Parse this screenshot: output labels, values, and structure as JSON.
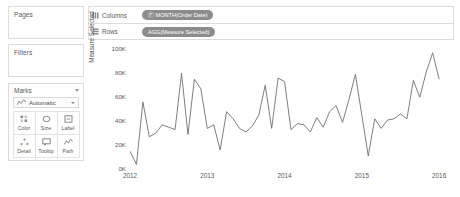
{
  "sidebar": {
    "pages": {
      "label": "Pages"
    },
    "filters": {
      "label": "Filters"
    },
    "marks": {
      "label": "Marks",
      "type_label": "Automatic",
      "type_icon": "line-chart-icon",
      "buttons": [
        {
          "label": "Color",
          "icon": "color-icon"
        },
        {
          "label": "Size",
          "icon": "size-icon"
        },
        {
          "label": "Label",
          "icon": "label-icon"
        },
        {
          "label": "Detail",
          "icon": "detail-icon"
        },
        {
          "label": "Tooltip",
          "icon": "tooltip-icon"
        },
        {
          "label": "Path",
          "icon": "path-icon"
        }
      ]
    }
  },
  "shelves": [
    {
      "label": "Columns",
      "icon": "columns-icon",
      "pill": "Ⓕ MONTH(Order Date)"
    },
    {
      "label": "Rows",
      "icon": "rows-icon",
      "pill": "AGG(Measure Selected)"
    }
  ],
  "colors": {
    "pill_bg": "#8c8c8c",
    "pill_text": "#ffffff",
    "line": "#707070",
    "border": "#dcdcdc",
    "axis_text": "#5a5a5a"
  },
  "chart_data": {
    "type": "line",
    "title": "",
    "xlabel": "",
    "ylabel": "Measure Selected",
    "ylim": [
      0,
      100000
    ],
    "yticks": [
      0,
      20000,
      40000,
      60000,
      80000,
      100000
    ],
    "ytick_labels": [
      "0K",
      "20K",
      "40K",
      "60K",
      "80K",
      "100K"
    ],
    "xtick_labels": [
      "2012",
      "2013",
      "2014",
      "2015",
      "2016"
    ],
    "xtick_values": [
      0,
      12,
      24,
      36,
      48
    ],
    "xlim": [
      0,
      50
    ],
    "grid": false,
    "legend": null,
    "series": [
      {
        "name": "Measure Selected",
        "x": [
          0,
          1,
          2,
          3,
          4,
          5,
          6,
          7,
          8,
          9,
          10,
          11,
          12,
          13,
          14,
          15,
          16,
          17,
          18,
          19,
          20,
          21,
          22,
          23,
          24,
          25,
          26,
          27,
          28,
          29,
          30,
          31,
          32,
          33,
          34,
          35,
          36,
          37,
          38,
          39,
          40,
          41,
          42,
          43,
          44,
          45,
          46,
          47,
          48
        ],
        "values": [
          14000,
          3000,
          55000,
          26000,
          29000,
          36000,
          34000,
          32000,
          79000,
          28000,
          74000,
          66000,
          33000,
          36000,
          15000,
          47000,
          41000,
          33000,
          30000,
          35000,
          44000,
          69000,
          33000,
          75000,
          72000,
          32000,
          37000,
          36000,
          30000,
          42000,
          34000,
          47000,
          52000,
          38000,
          57000,
          78000,
          44000,
          10000,
          41000,
          33000,
          40000,
          41000,
          45000,
          41000,
          73000,
          59000,
          80000,
          96000,
          74000
        ]
      }
    ]
  }
}
